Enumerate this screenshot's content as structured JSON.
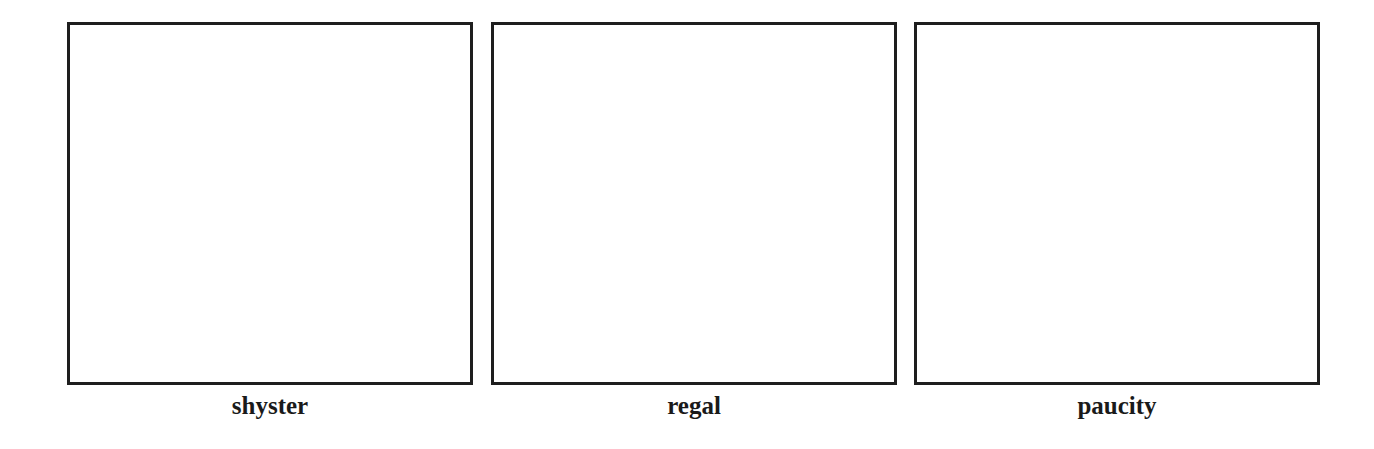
{
  "panels": [
    {
      "label": "shyster"
    },
    {
      "label": "regal"
    },
    {
      "label": "paucity"
    }
  ],
  "colors": {
    "border": "#1e1e1e",
    "background": "#ffffff",
    "text": "#1a1a1a"
  }
}
